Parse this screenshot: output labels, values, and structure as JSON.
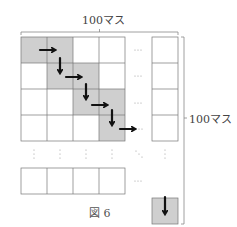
{
  "figure": {
    "caption": "図 6",
    "top_label": "100マス",
    "right_label": "100マス",
    "colors": {
      "shaded_cell": "#cfcfcf",
      "grid_line": "#777777",
      "arrow": "#111111",
      "bracket": "#888888"
    },
    "grid": {
      "visible_rows": 4,
      "visible_cols": 4,
      "shaded_cells": [
        [
          0,
          0
        ],
        [
          0,
          1
        ],
        [
          1,
          1
        ],
        [
          1,
          2
        ],
        [
          2,
          2
        ],
        [
          2,
          3
        ],
        [
          3,
          3
        ]
      ],
      "arrows": [
        {
          "from": [
            0,
            0
          ],
          "direction": "right"
        },
        {
          "from": [
            0,
            1
          ],
          "direction": "down"
        },
        {
          "from": [
            1,
            1
          ],
          "direction": "right"
        },
        {
          "from": [
            1,
            2
          ],
          "direction": "down"
        },
        {
          "from": [
            2,
            2
          ],
          "direction": "right"
        },
        {
          "from": [
            2,
            3
          ],
          "direction": "down"
        },
        {
          "from": [
            3,
            3
          ],
          "direction": "right"
        },
        {
          "into": "bottom-right",
          "direction": "down"
        }
      ],
      "ellipsis_horizontal": "…",
      "ellipsis_vertical": "⋮",
      "ellipsis_diagonal": "⋱"
    }
  }
}
